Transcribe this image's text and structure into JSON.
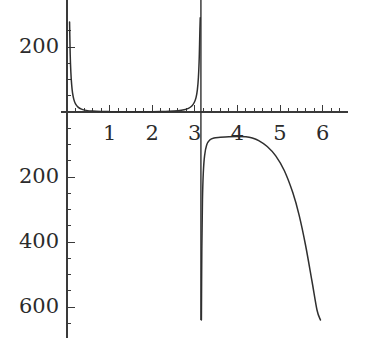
{
  "chart_data": {
    "type": "line",
    "title": "",
    "xlabel": "",
    "ylabel": "",
    "xlim": [
      -0.15,
      6.6
    ],
    "ylim": [
      -640,
      290
    ],
    "grid": false,
    "legend": null,
    "x_ticks_major": [
      1,
      2,
      3,
      4,
      5,
      6
    ],
    "x_tick_labels": [
      "1",
      "2",
      "3",
      "4",
      "5",
      "6"
    ],
    "x_minor_tick_step": 0.2,
    "y_ticks_major": [
      200,
      -200,
      -400,
      -600
    ],
    "y_tick_labels": [
      "200",
      "200",
      "400",
      "600"
    ],
    "y_minor_tick_step": 50,
    "asymptotes": [
      0.0,
      3.14159
    ],
    "axes": {
      "x_axis_y_value": 0,
      "y_axis_x_value": 0
    },
    "series": [
      {
        "name": "branch-left",
        "domain": [
          0.06,
          3.1
        ],
        "points": [
          [
            0.06,
            277
          ],
          [
            0.075,
            178
          ],
          [
            0.09,
            124
          ],
          [
            0.11,
            83
          ],
          [
            0.13,
            59
          ],
          [
            0.16,
            39
          ],
          [
            0.2,
            25
          ],
          [
            0.26,
            15
          ],
          [
            0.34,
            8.7
          ],
          [
            0.45,
            5.0
          ],
          [
            0.6,
            2.8
          ],
          [
            0.8,
            1.6
          ],
          [
            1.0,
            1.1
          ],
          [
            1.2,
            0.9
          ],
          [
            1.4,
            0.8
          ],
          [
            1.571,
            0.8
          ],
          [
            1.8,
            0.9
          ],
          [
            2.0,
            1.1
          ],
          [
            2.2,
            1.5
          ],
          [
            2.4,
            2.3
          ],
          [
            2.6,
            4.0
          ],
          [
            2.75,
            6.9
          ],
          [
            2.85,
            11.2
          ],
          [
            2.93,
            18.5
          ],
          [
            2.99,
            30.0
          ],
          [
            3.03,
            45.0
          ],
          [
            3.06,
            68.0
          ],
          [
            3.085,
            107.0
          ],
          [
            3.105,
            170.0
          ],
          [
            3.12,
            255.0
          ],
          [
            3.128,
            290.0
          ]
        ]
      },
      {
        "name": "branch-right",
        "domain": [
          3.155,
          5.95
        ],
        "points": [
          [
            3.155,
            -640
          ],
          [
            3.165,
            -420
          ],
          [
            3.18,
            -270
          ],
          [
            3.2,
            -186
          ],
          [
            3.23,
            -134
          ],
          [
            3.28,
            -101
          ],
          [
            3.35,
            -86
          ],
          [
            3.45,
            -80
          ],
          [
            3.6,
            -78
          ],
          [
            3.8,
            -76
          ],
          [
            4.0,
            -75
          ],
          [
            4.2,
            -76
          ],
          [
            4.35,
            -80
          ],
          [
            4.5,
            -88
          ],
          [
            4.7,
            -106
          ],
          [
            4.9,
            -135
          ],
          [
            5.1,
            -180
          ],
          [
            5.3,
            -248
          ],
          [
            5.45,
            -318
          ],
          [
            5.6,
            -410
          ],
          [
            5.75,
            -520
          ],
          [
            5.87,
            -610
          ],
          [
            5.95,
            -640
          ]
        ]
      }
    ]
  },
  "labels": {
    "y_200_pos": "200",
    "y_200_neg": "200",
    "y_400_neg": "400",
    "y_600_neg": "600",
    "x_1": "1",
    "x_2": "2",
    "x_3": "3",
    "x_4": "4",
    "x_5": "5",
    "x_6": "6"
  },
  "style": {
    "curve_color": "#2f2f2f",
    "axis_color": "#3a3a3a",
    "label_color": "#2b2b2b",
    "background": "#ffffff"
  }
}
